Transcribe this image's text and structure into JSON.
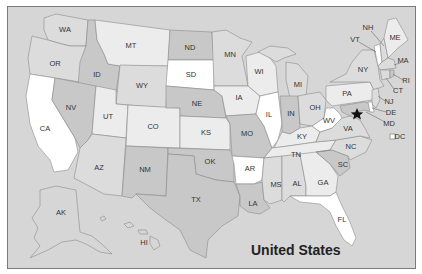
{
  "map": {
    "title": "United States",
    "capital_marker": "star-icon",
    "colors": {
      "ocean": "#d6d6d6",
      "white": "#ffffff",
      "light": "#ececec",
      "mid": "#dcdcdc",
      "dark": "#c8c8c8",
      "border": "#8c8c8c",
      "frame": "#7a7a7a"
    },
    "states": [
      {
        "abbr": "WA",
        "x": 65,
        "y": 30
      },
      {
        "abbr": "OR",
        "x": 55,
        "y": 64
      },
      {
        "abbr": "CA",
        "x": 45,
        "y": 129
      },
      {
        "abbr": "ID",
        "x": 97,
        "y": 75
      },
      {
        "abbr": "NV",
        "x": 71,
        "y": 108
      },
      {
        "abbr": "MT",
        "x": 131,
        "y": 46
      },
      {
        "abbr": "WY",
        "x": 142,
        "y": 86
      },
      {
        "abbr": "UT",
        "x": 108,
        "y": 117
      },
      {
        "abbr": "CO",
        "x": 153,
        "y": 127
      },
      {
        "abbr": "AZ",
        "x": 99,
        "y": 168
      },
      {
        "abbr": "NM",
        "x": 145,
        "y": 170
      },
      {
        "abbr": "ND",
        "x": 190,
        "y": 48
      },
      {
        "abbr": "SD",
        "x": 191,
        "y": 75
      },
      {
        "abbr": "NE",
        "x": 197,
        "y": 104
      },
      {
        "abbr": "KS",
        "x": 206,
        "y": 133
      },
      {
        "abbr": "OK",
        "x": 210,
        "y": 162
      },
      {
        "abbr": "TX",
        "x": 196,
        "y": 200
      },
      {
        "abbr": "MN",
        "x": 230,
        "y": 55
      },
      {
        "abbr": "IA",
        "x": 239,
        "y": 98
      },
      {
        "abbr": "MO",
        "x": 247,
        "y": 134
      },
      {
        "abbr": "AR",
        "x": 250,
        "y": 169
      },
      {
        "abbr": "LA",
        "x": 253,
        "y": 204
      },
      {
        "abbr": "WI",
        "x": 259,
        "y": 72
      },
      {
        "abbr": "IL",
        "x": 269,
        "y": 115
      },
      {
        "abbr": "MI",
        "x": 298,
        "y": 85
      },
      {
        "abbr": "IN",
        "x": 291,
        "y": 114
      },
      {
        "abbr": "OH",
        "x": 315,
        "y": 108
      },
      {
        "abbr": "KY",
        "x": 302,
        "y": 137
      },
      {
        "abbr": "TN",
        "x": 296,
        "y": 155
      },
      {
        "abbr": "MS",
        "x": 276,
        "y": 185
      },
      {
        "abbr": "AL",
        "x": 297,
        "y": 184
      },
      {
        "abbr": "GA",
        "x": 323,
        "y": 183
      },
      {
        "abbr": "FL",
        "x": 342,
        "y": 220
      },
      {
        "abbr": "SC",
        "x": 343,
        "y": 165
      },
      {
        "abbr": "NC",
        "x": 351,
        "y": 147
      },
      {
        "abbr": "WV",
        "x": 329,
        "y": 121
      },
      {
        "abbr": "VA",
        "x": 348,
        "y": 129
      },
      {
        "abbr": "PA",
        "x": 347,
        "y": 94
      },
      {
        "abbr": "NY",
        "x": 363,
        "y": 70
      },
      {
        "abbr": "VT",
        "x": 355,
        "y": 40
      },
      {
        "abbr": "NH",
        "x": 368,
        "y": 28
      },
      {
        "abbr": "ME",
        "x": 395,
        "y": 38
      },
      {
        "abbr": "MA",
        "x": 403,
        "y": 61
      },
      {
        "abbr": "RI",
        "x": 406,
        "y": 81
      },
      {
        "abbr": "CT",
        "x": 398,
        "y": 91
      },
      {
        "abbr": "NJ",
        "x": 389,
        "y": 102
      },
      {
        "abbr": "DE",
        "x": 391,
        "y": 113
      },
      {
        "abbr": "MD",
        "x": 389,
        "y": 124
      },
      {
        "abbr": "DC",
        "x": 400,
        "y": 137
      },
      {
        "abbr": "AK",
        "x": 61,
        "y": 213
      },
      {
        "abbr": "HI",
        "x": 144,
        "y": 243
      }
    ]
  }
}
